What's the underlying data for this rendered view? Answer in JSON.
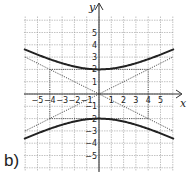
{
  "part_label": "b)",
  "axes": {
    "x_label": "x",
    "y_label": "y",
    "x_ticks": [
      "−5",
      "−4",
      "−3",
      "−2",
      "−1",
      "1",
      "2",
      "3",
      "4",
      "5"
    ],
    "y_ticks": [
      "5",
      "4",
      "3",
      "2",
      "1",
      "−1",
      "−2",
      "−3",
      "−4",
      "−5"
    ]
  },
  "colors": {
    "grid": "#9a9a9a",
    "axis": "#333333",
    "curve": "#222222",
    "asymptote": "#555555"
  },
  "chart_data": {
    "type": "line",
    "title": "",
    "xlabel": "x",
    "ylabel": "y",
    "xlim": [
      -6,
      6
    ],
    "ylim": [
      -6,
      6
    ],
    "grid": true,
    "series": [
      {
        "name": "hyperbola upper branch",
        "equation": "y = 2*sqrt(1 + x^2/16)",
        "x": [
          -6,
          -4,
          -2,
          0,
          2,
          4,
          6
        ],
        "y": [
          3.61,
          2.83,
          2.24,
          2,
          2.24,
          2.83,
          3.61
        ]
      },
      {
        "name": "hyperbola lower branch",
        "equation": "y = -2*sqrt(1 + x^2/16)",
        "x": [
          -6,
          -4,
          -2,
          0,
          2,
          4,
          6
        ],
        "y": [
          -3.61,
          -2.83,
          -2.24,
          -2,
          -2.24,
          -2.83,
          -3.61
        ]
      },
      {
        "name": "asymptote y = x/2",
        "style": "dotted",
        "x": [
          -6,
          6
        ],
        "y": [
          -3,
          3
        ]
      },
      {
        "name": "asymptote y = -x/2",
        "style": "dotted",
        "x": [
          -6,
          6
        ],
        "y": [
          3,
          -3
        ]
      }
    ],
    "annotations": [
      "dotted rectangle x=±4, y=±2 (fundamental rectangle)",
      "vertices at (0, 2) and (0, -2)"
    ]
  }
}
